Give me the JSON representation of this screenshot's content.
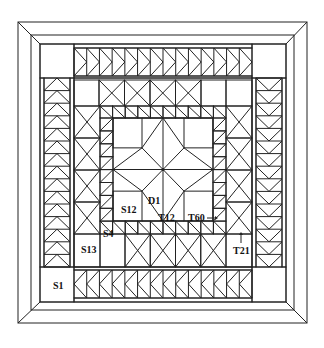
{
  "diagram": {
    "type": "quilt-pattern",
    "colors": {
      "line": "#222222",
      "background": "#ffffff"
    },
    "labels": {
      "s1": "S1",
      "s4": "S4",
      "s12": "S12",
      "s13": "S13",
      "d1": "D1",
      "t12": "T12",
      "t60": "T60",
      "t21": "T21"
    }
  }
}
